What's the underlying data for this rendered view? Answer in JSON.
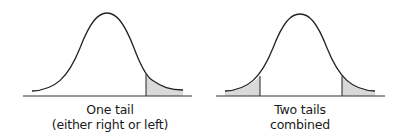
{
  "panels": [
    {
      "id": "one-tail",
      "caption_line1": "One tail",
      "caption_line2": "(either right or left)",
      "shaded_regions": [
        "right"
      ]
    },
    {
      "id": "two-tails",
      "caption_line1": "Two tails",
      "caption_line2": "combined",
      "shaded_regions": [
        "left",
        "right"
      ]
    }
  ],
  "colors": {
    "curve": "#222222",
    "shade": "#d9d9d9",
    "baseline": "#333333"
  }
}
